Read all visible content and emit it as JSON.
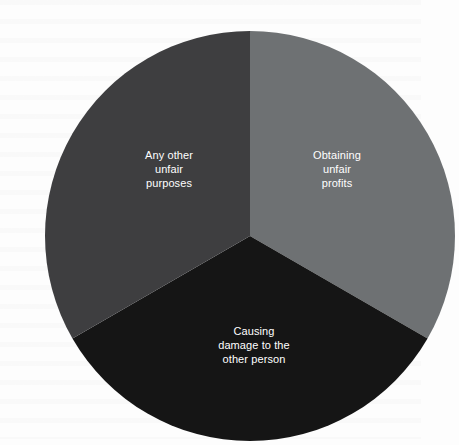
{
  "chart_data": {
    "type": "pie",
    "title": "",
    "subtitle": "",
    "xlabel": "",
    "ylabel": "",
    "grid": false,
    "legend": "none",
    "labels_position": "inside-slice",
    "start_angle_deg": 0,
    "direction": "clockwise",
    "categories": [
      "Obtaining unfair profits",
      "Causing damage to the other person",
      "Any other unfair purposes"
    ],
    "values": [
      33.3,
      33.3,
      33.3
    ],
    "units": "percent",
    "slices": [
      {
        "name": "obtaining-unfair-profits",
        "label": "Obtaining\nunfair\nprofits",
        "value": 33.3,
        "angle_deg": 120,
        "start_angle_deg": 0,
        "end_angle_deg": 120,
        "color": "#6e7173"
      },
      {
        "name": "causing-damage-to-the-other-person",
        "label": "Causing\ndamage to the\nother person",
        "value": 33.3,
        "angle_deg": 120,
        "start_angle_deg": 120,
        "end_angle_deg": 240,
        "color": "#151515"
      },
      {
        "name": "any-other-unfair-purposes",
        "label": "Any other\nunfair\npurposes",
        "value": 33.3,
        "angle_deg": 120,
        "start_angle_deg": 240,
        "end_angle_deg": 360,
        "color": "#3e3e40"
      }
    ],
    "geometry": {
      "center_x": 210,
      "center_y": 220,
      "radius": 205
    },
    "label_color": "#ffffff",
    "background_color": "#fdfdfd"
  }
}
